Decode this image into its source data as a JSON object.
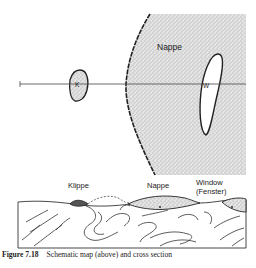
{
  "map": {
    "nappe_label": "Nappe",
    "klippe_marker": "K",
    "window_marker": "W"
  },
  "cross_section": {
    "labels": {
      "klippe": "Klippe",
      "nappe": "Nappe",
      "window": "Window",
      "window_alt": "(Fenster)"
    }
  },
  "caption": {
    "figure_number": "Figure 7.18",
    "text": "Schematic map (above) and cross section"
  },
  "colors": {
    "ink": "#222222",
    "stipple_bg": "#d9d9d9",
    "paper": "#ffffff"
  }
}
